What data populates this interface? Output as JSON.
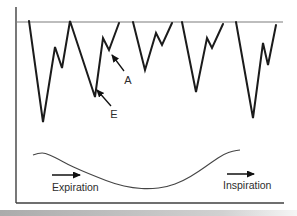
{
  "figure": {
    "colors": {
      "background": "#ffffff",
      "waveform": "#1b1b1b",
      "axis": "#3f3f3f",
      "baseline": "#7d7d7d",
      "respiration": "#454545",
      "arrow": "#111111",
      "text": "#2d2d2d",
      "shadow_left": "#9c9c9c",
      "shadow_right": "#f4f4f4"
    },
    "labels": {
      "a_wave": "A",
      "e_wave": "E",
      "expiration": "Expiration",
      "inspiration": "Inspiration"
    },
    "axes": {
      "y_axis": {
        "x1": 16,
        "y1": 7,
        "x2": 16,
        "y2": 203
      },
      "x_axis": {
        "x1": 16,
        "y1": 203,
        "x2": 284,
        "y2": 203
      },
      "baseline": {
        "x1": 16,
        "y1": 22,
        "x2": 283,
        "y2": 22
      }
    },
    "waveform_beats": [
      [
        [
          29,
          21
        ],
        [
          43,
          122
        ],
        [
          55,
          47
        ],
        [
          62,
          68
        ],
        [
          70,
          21
        ],
        [
          95,
          97
        ],
        [
          103,
          38
        ],
        [
          109,
          50
        ],
        [
          119,
          23
        ]
      ],
      [
        [
          133,
          22
        ],
        [
          145,
          70
        ],
        [
          156,
          33
        ],
        [
          162,
          45
        ],
        [
          172,
          23
        ]
      ],
      [
        [
          182,
          22
        ],
        [
          196,
          92
        ],
        [
          207,
          38
        ],
        [
          212,
          48
        ],
        [
          223,
          24
        ]
      ],
      [
        [
          236,
          22
        ],
        [
          253,
          118
        ],
        [
          263,
          43
        ],
        [
          268,
          65
        ],
        [
          276,
          25
        ]
      ]
    ],
    "respiration_curve": [
      [
        33,
        155
      ],
      [
        41,
        152
      ],
      [
        50,
        155
      ],
      [
        60,
        160
      ],
      [
        67,
        164
      ],
      [
        80,
        170
      ],
      [
        97,
        177
      ],
      [
        115,
        184
      ],
      [
        133,
        188
      ],
      [
        150,
        189
      ],
      [
        167,
        187
      ],
      [
        183,
        181
      ],
      [
        198,
        172
      ],
      [
        212,
        162
      ],
      [
        224,
        154
      ],
      [
        233,
        151
      ],
      [
        240,
        150
      ]
    ],
    "annotation_arrows": {
      "a_arrow": {
        "x1": 124,
        "y1": 71,
        "x2": 112,
        "y2": 55
      },
      "e_arrow": {
        "x1": 111,
        "y1": 106,
        "x2": 97,
        "y2": 90
      }
    },
    "flow_arrows": {
      "expiration_arrow": {
        "x1": 52,
        "y1": 175,
        "x2": 80,
        "y2": 175
      },
      "inspiration_arrow": {
        "x1": 227,
        "y1": 174,
        "x2": 254,
        "y2": 174
      }
    }
  }
}
